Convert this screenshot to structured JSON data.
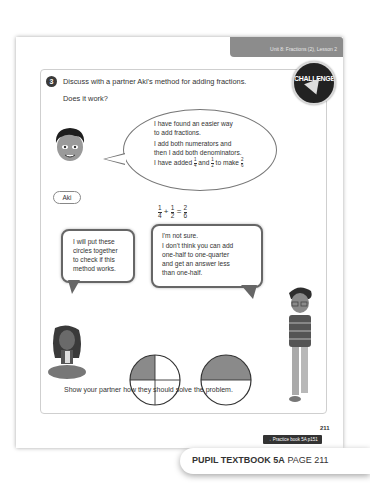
{
  "header": {
    "unit_lesson": "Unit 8: Fractions (2), Lesson 2",
    "bar_color": "#8c8c8c"
  },
  "question": {
    "number": "3",
    "text": "Discuss with a partner Aki's method for adding fractions.",
    "subtext": "Does it work?",
    "badge_label": "CHALLENGE"
  },
  "aki": {
    "name": "Aki",
    "bubble_lines": [
      "I have found an easier way",
      "to add fractions.",
      "I add both numerators and",
      "then I add both denominators.",
      "I have added"
    ],
    "bubble_fraction_1": {
      "num": "1",
      "den": "4"
    },
    "bubble_and": "and",
    "bubble_fraction_2": {
      "num": "1",
      "den": "2"
    },
    "bubble_to_make": "to make",
    "bubble_fraction_3": {
      "num": "2",
      "den": "6"
    }
  },
  "equation": {
    "a": {
      "num": "1",
      "den": "4"
    },
    "plus": "+",
    "b": {
      "num": "1",
      "den": "2"
    },
    "equals": "=",
    "c": {
      "num": "2",
      "den": "6"
    }
  },
  "girl_bubble": {
    "lines": [
      "I will put these",
      "circles together",
      "to check if this",
      "method works."
    ]
  },
  "boy_bubble": {
    "lines": [
      "I'm not sure.",
      "I don't think you can add",
      "one-half to one-quarter",
      "and get an answer less",
      "than one-half."
    ]
  },
  "circles": [
    {
      "name": "quarter-circle",
      "parts": 4,
      "shaded": 1,
      "fill": "#8a8a8a"
    },
    {
      "name": "half-circle",
      "parts": 2,
      "shaded": 1,
      "fill": "#8a8a8a"
    }
  ],
  "instruction": "Show your partner how they should solve the problem.",
  "page_number": "211",
  "practice_link": "→ Practice book 5A p151",
  "footer": {
    "book": "PUPIL TEXTBOOK 5A",
    "page": "PAGE 211"
  }
}
